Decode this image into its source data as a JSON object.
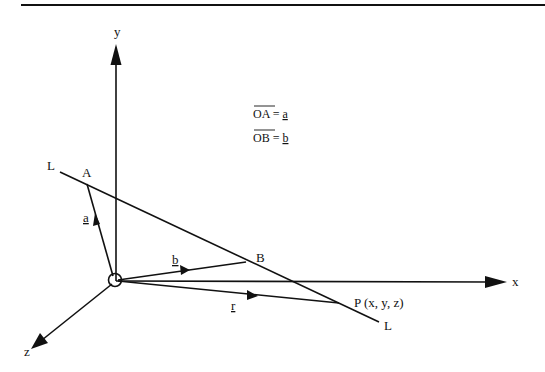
{
  "figure": {
    "type": "3d-vector-diagram",
    "colors": {
      "ink": "#111111",
      "background": "#ffffff"
    }
  },
  "axes": {
    "x_label": "x",
    "y_label": "y",
    "z_label": "z",
    "origin_marker": "circle"
  },
  "points": {
    "A": "A",
    "B": "B",
    "P": "P (x, y, z)"
  },
  "line": {
    "label_start": "L",
    "label_end": "L"
  },
  "vectors": {
    "a": "a",
    "b": "b",
    "r": "r"
  },
  "equations": [
    {
      "lhs": "OA",
      "eq": " = ",
      "rhs": "a"
    },
    {
      "lhs": "OB",
      "eq": " = ",
      "rhs": "b"
    }
  ]
}
